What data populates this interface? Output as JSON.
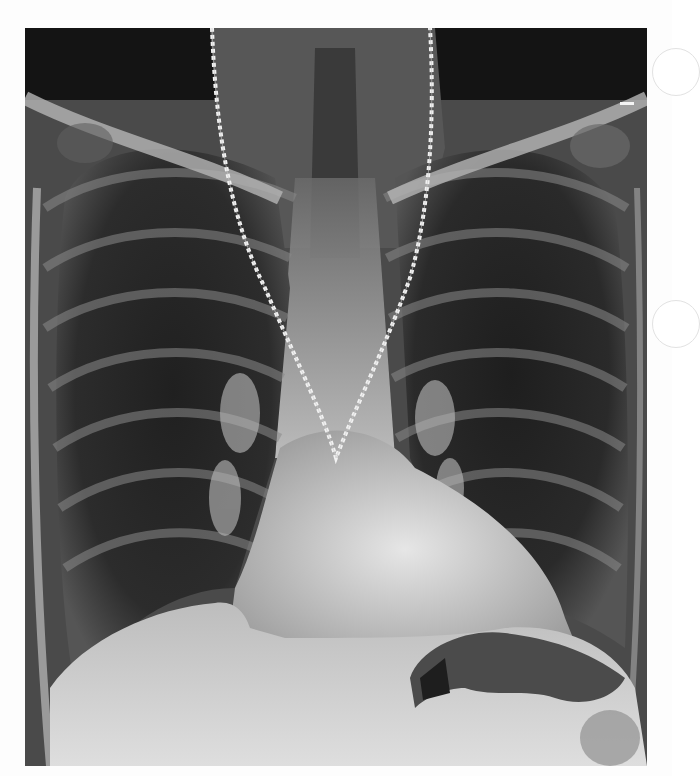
{
  "image": {
    "kind": "chest-radiograph",
    "view": "frontal (PA)",
    "visible_text": [],
    "notable_features": [
      "metal neck chain projecting over upper mediastinum forming a V shape",
      "clavicles and rib cage",
      "cardiac silhouette",
      "bilateral lung fields",
      "gastric air bubble below left hemidiaphragm",
      "punch-hole circles on right margin"
    ],
    "colors": {
      "background": "#fdfdfd",
      "film_dark": "#1a1a1a",
      "soft_tissue": "#6e6e6e",
      "bone_bright": "#d8d8d8",
      "chain": "#f0f0f0"
    }
  }
}
